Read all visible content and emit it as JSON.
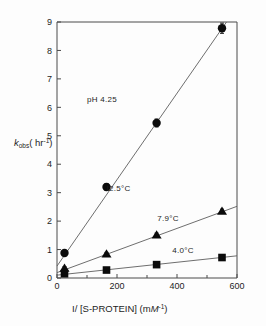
{
  "figure": {
    "background_color": "#fdfdfd",
    "axis_color": "#4a4a4a",
    "marker_color": "#0b0b0b",
    "line_color": "#5e5e5e"
  },
  "chart_data": {
    "type": "scatter",
    "title": "",
    "xlabel": "I/[S-PROTEIN] (mM⁻¹)",
    "ylabel": "kₒₑₛ (hr⁻¹)",
    "xlabel_parts": {
      "main": "I/ [S-PROTEIN]  (m",
      "italic": "M",
      "exponent": "-1",
      "close": ")"
    },
    "ylabel_parts": {
      "italic": "k",
      "subscript": "obs",
      "open": "( hr",
      "exponent": "-1",
      "close": ")"
    },
    "xlim": [
      0,
      600
    ],
    "ylim": [
      0,
      9
    ],
    "xticks": [
      0,
      200,
      400,
      600
    ],
    "xticklabels": [
      "0",
      "200",
      "400",
      "600"
    ],
    "xminorticks": [
      100,
      300,
      500
    ],
    "yticks": [
      0,
      1,
      2,
      3,
      4,
      5,
      6,
      7,
      8,
      9
    ],
    "yticklabels": [
      "0",
      "1",
      "2",
      "3",
      "4",
      "5",
      "6",
      "7",
      "8",
      "9"
    ],
    "grid": false,
    "legend_position": "inline-annotations",
    "annotations": [
      {
        "name": "ph-annotation",
        "text": "pH 4.25",
        "x": 150,
        "y": 6.2
      },
      {
        "name": "series-label-12p5c",
        "text": "I2.5°C",
        "x": 205,
        "y": 3.05
      },
      {
        "name": "series-label-7p9c",
        "text": "7.9°C",
        "x": 370,
        "y": 2.02
      },
      {
        "name": "series-label-4p0c",
        "text": "4.0°C",
        "x": 420,
        "y": 0.88
      }
    ],
    "series": [
      {
        "name": "12.5°C",
        "marker": "circle",
        "label": "I2.5°C",
        "x": [
          25,
          165,
          332,
          550
        ],
        "values": [
          0.88,
          3.2,
          5.45,
          8.78
        ],
        "yerr": [
          0.08,
          0.12,
          0.14,
          0.18
        ],
        "fit": {
          "x0": 0,
          "y0": 0.42,
          "x1": 565,
          "y1": 9.0
        }
      },
      {
        "name": "7.9°C",
        "marker": "triangle",
        "label": "7.9°C",
        "x": [
          25,
          165,
          332,
          550
        ],
        "values": [
          0.35,
          0.85,
          1.52,
          2.35
        ],
        "yerr": [
          0.05,
          0.05,
          0.06,
          0.07
        ],
        "fit": {
          "x0": 0,
          "y0": 0.19,
          "x1": 600,
          "y1": 2.52
        }
      },
      {
        "name": "4.0°C",
        "marker": "square",
        "label": "4.0°C",
        "x": [
          25,
          165,
          332,
          550
        ],
        "values": [
          0.15,
          0.28,
          0.47,
          0.72
        ],
        "yerr": [
          0.03,
          0.03,
          0.04,
          0.04
        ],
        "fit": {
          "x0": 0,
          "y0": 0.1,
          "x1": 600,
          "y1": 0.78
        }
      }
    ]
  }
}
